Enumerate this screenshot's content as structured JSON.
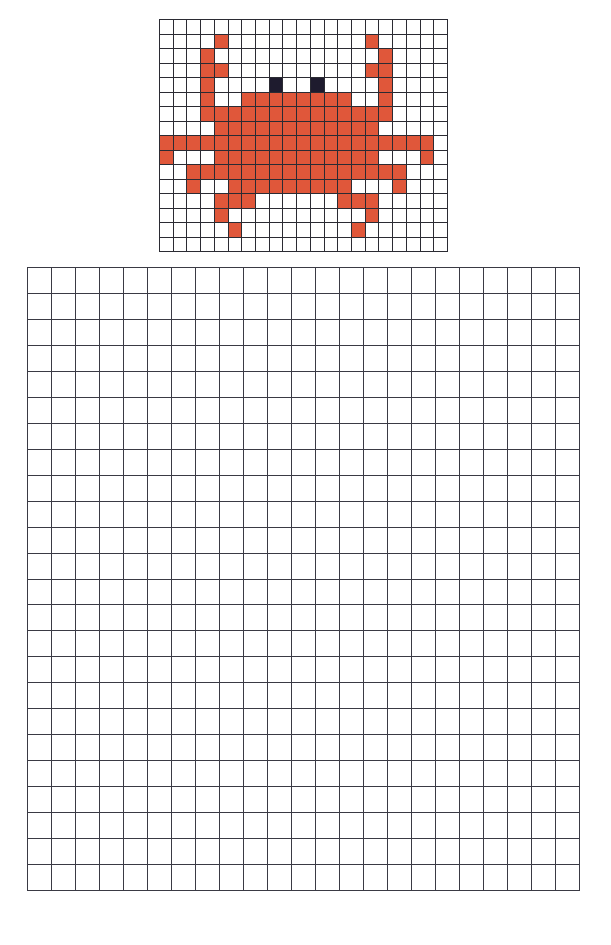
{
  "pattern": {
    "title": "crab pixel pattern",
    "columns": 21,
    "rows": 16,
    "palette": {
      ".": "#ffffff",
      "o": "#e0573a",
      "b": "#1e1b2e"
    },
    "legend": {
      "o": "crab-body-orange",
      "b": "crab-eye-black",
      ".": "empty"
    },
    "cells": [
      ".....................",
      "....o..........o.....",
      "...o............o....",
      "...oo..........oo....",
      "...o....b..b....o....",
      "...o..oooooooo..o....",
      "...oooooooooooooo....",
      "....oooooooooooo.....",
      "oooooooooooooooooooo.",
      "o...oooooooooooo...o.",
      "..oooooooooooooooo...",
      "..o..ooooooooo...o...",
      "....ooo......ooo.....",
      "....o..........o.....",
      ".....o........o......",
      "....................."
    ]
  },
  "drawing_grid": {
    "columns": 23,
    "rows": 24,
    "fill": "#ffffff",
    "line_color": "#3a3a44"
  }
}
